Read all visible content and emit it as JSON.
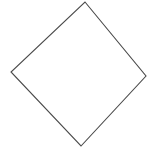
{
  "canvas": {
    "width": 157,
    "height": 152,
    "background_color": "#ffffff",
    "title": "diamond-outline-drawing"
  },
  "figure": {
    "name": "rotated-square-diamond",
    "shape_type": "quadrilateral",
    "stroke_color": "#4a4a4a",
    "stroke_width": 1.1,
    "fill_color": "none",
    "vertex_labels": [
      "top",
      "right",
      "bottom",
      "left"
    ],
    "vertices": [
      {
        "label": "top",
        "x": 85,
        "y": 2
      },
      {
        "label": "right",
        "x": 146,
        "y": 76
      },
      {
        "label": "bottom",
        "x": 81,
        "y": 146
      },
      {
        "label": "left",
        "x": 11,
        "y": 72
      }
    ],
    "points_attr": "85,2 146,76 81,146 11,72",
    "edges": [
      {
        "name": "top-right-edge",
        "from": "top",
        "to": "right"
      },
      {
        "name": "bottom-right-edge",
        "from": "right",
        "to": "bottom"
      },
      {
        "name": "bottom-left-edge",
        "from": "bottom",
        "to": "left"
      },
      {
        "name": "top-left-edge",
        "from": "left",
        "to": "top"
      }
    ]
  }
}
